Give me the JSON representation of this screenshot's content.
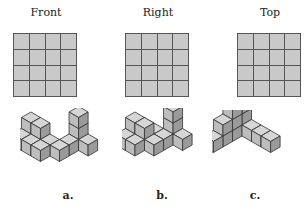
{
  "views": [
    {
      "label": "Front",
      "rows": 4,
      "cols": 4
    },
    {
      "label": "Right",
      "rows": 4,
      "cols": 4
    },
    {
      "label": "Top",
      "rows": 4,
      "cols": 4
    }
  ],
  "options": [
    {
      "label": "a."
    },
    {
      "label": "b."
    },
    {
      "label": "c."
    }
  ],
  "colors": {
    "cell_fill": "#c9c9c9",
    "grid_line": "#555555",
    "cube_top": "#d6d6d6",
    "cube_left": "#bdbdbd",
    "cube_right": "#9a9a9a"
  }
}
